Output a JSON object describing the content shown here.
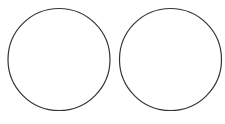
{
  "diagram": {
    "background": "#ffffff",
    "stroke_color": "#333333",
    "stroke_width": 1.2,
    "shapes": [
      {
        "type": "circle",
        "name": "left-circle",
        "cx": 59,
        "cy": 59.5,
        "r": 51
      },
      {
        "type": "circle",
        "name": "right-circle",
        "cx": 170.5,
        "cy": 59.5,
        "r": 51
      }
    ]
  }
}
